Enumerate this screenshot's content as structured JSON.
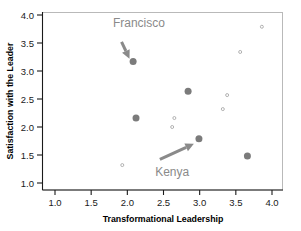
{
  "chart_data": {
    "type": "scatter",
    "title": "",
    "xlabel": "Transformational Leadership",
    "ylabel": "Satisfaction with the Leader",
    "xlim": [
      0.8,
      4.15
    ],
    "ylim": [
      0.88,
      4.12
    ],
    "xticks": [
      "1.0",
      "1.5",
      "2.0",
      "2.5",
      "3.0",
      "3.5",
      "4.0"
    ],
    "xtick_values": [
      1.0,
      1.5,
      2.0,
      2.5,
      3.0,
      3.5,
      4.0
    ],
    "yticks": [
      "1.0",
      "1.5",
      "2.0",
      "2.5",
      "3.0",
      "3.5",
      "4.0"
    ],
    "ytick_values": [
      1.0,
      1.5,
      2.0,
      2.5,
      3.0,
      3.5,
      4.0
    ],
    "grid": false,
    "legend": "none",
    "series": [
      {
        "name": "highlighted-cases",
        "marker": "filled-circle",
        "color": "#7b7b7b",
        "size": 7,
        "points": [
          {
            "x": 2.08,
            "y": 3.17
          },
          {
            "x": 2.12,
            "y": 2.16
          },
          {
            "x": 2.84,
            "y": 2.64
          },
          {
            "x": 2.99,
            "y": 1.79
          },
          {
            "x": 3.66,
            "y": 1.48
          }
        ]
      },
      {
        "name": "other-cases",
        "marker": "open-circle",
        "color": "#a9a9a9",
        "size": 3,
        "points": [
          {
            "x": 1.93,
            "y": 1.32
          },
          {
            "x": 2.62,
            "y": 2.0
          },
          {
            "x": 2.65,
            "y": 2.16
          },
          {
            "x": 3.32,
            "y": 2.32
          },
          {
            "x": 3.38,
            "y": 2.57
          },
          {
            "x": 3.56,
            "y": 3.34
          },
          {
            "x": 3.86,
            "y": 3.79
          }
        ]
      }
    ],
    "annotations": [
      {
        "name": "francisco",
        "label": "Francisco",
        "label_x": 2.16,
        "label_y": 3.78,
        "arrow_from_x": 1.92,
        "arrow_from_y": 3.52,
        "arrow_to_x": 2.03,
        "arrow_to_y": 3.22,
        "color": "#8a8a8a"
      },
      {
        "name": "kenya",
        "label": "Kenya",
        "label_x": 2.62,
        "label_y": 1.12,
        "arrow_from_x": 2.45,
        "arrow_from_y": 1.42,
        "arrow_to_x": 2.92,
        "arrow_to_y": 1.7,
        "color": "#8a8a8a"
      }
    ]
  }
}
